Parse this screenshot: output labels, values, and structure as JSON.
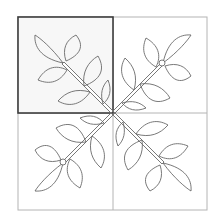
{
  "diagram": {
    "block": {
      "x": 18,
      "y": 17,
      "width": 189,
      "height": 193,
      "center_x": 113,
      "center_y": 113
    },
    "highlighted_quadrant": "top-left",
    "colors": {
      "outline": "#6a6a6a",
      "grid_line": "#b4b4b4",
      "highlight_border": "#3c3c3c",
      "highlight_fill": "#f7f7f7",
      "background": "#ffffff"
    },
    "branches": [
      {
        "name": "top-left",
        "rotation": 0,
        "knot": false
      },
      {
        "name": "top-right",
        "rotation": 90,
        "knot": true
      },
      {
        "name": "bottom-right",
        "rotation": 180,
        "knot": false
      },
      {
        "name": "bottom-left",
        "rotation": 270,
        "knot": true
      }
    ],
    "leaves_per_branch": 6
  }
}
